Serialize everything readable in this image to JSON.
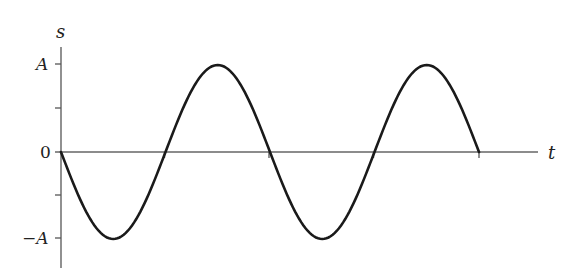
{
  "chart_data": {
    "type": "line",
    "title": "",
    "xlabel": "t",
    "ylabel": "s",
    "y_ticks": [
      {
        "label": "A",
        "value": 1
      },
      {
        "label": "",
        "value": 0.5
      },
      {
        "label": "0",
        "value": 0
      },
      {
        "label": "",
        "value": -0.5
      },
      {
        "label": "-A",
        "value": -1
      }
    ],
    "x_ticks_at_zero_crossings": [
      0,
      0.5,
      1.0,
      1.5,
      2.0
    ],
    "x_unit": "period T",
    "series": [
      {
        "name": "s(t)",
        "function": "-A*sin(2*pi*t/T)",
        "x": [
          0,
          0.25,
          0.5,
          0.75,
          1.0,
          1.25,
          1.5,
          1.75,
          2.0
        ],
        "values": [
          0,
          -1,
          0,
          1,
          0,
          -1,
          0,
          1,
          0
        ]
      }
    ],
    "ylim": [
      -1.25,
      1.3
    ],
    "grid": false,
    "legend": null,
    "colors": {
      "curve": "#1a1a1a",
      "axis": "#555555"
    }
  },
  "labels": {
    "y_axis": "s",
    "x_axis": "t",
    "y_top": "A",
    "y_zero": "0",
    "y_bottom": "−A"
  }
}
